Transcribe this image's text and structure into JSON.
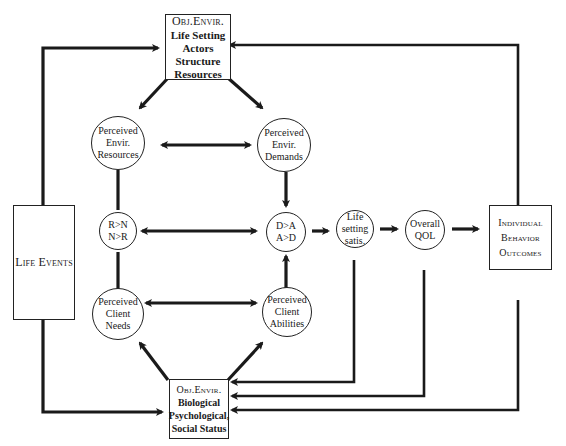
{
  "diagram": {
    "type": "flow-model",
    "boxes": {
      "obj_envir_top": {
        "lines": [
          "Obj.Envir.",
          "Life Setting",
          "Actors",
          "Structure",
          "Resources"
        ]
      },
      "life_events": {
        "lines": [
          "Life Events"
        ]
      },
      "individual_outcomes": {
        "lines": [
          "Individual",
          "Behavior",
          "Outcomes"
        ]
      },
      "obj_envir_bottom": {
        "lines": [
          "Obj.Envir.",
          "Biological",
          "Psychological,",
          "Social Status"
        ]
      }
    },
    "nodes": {
      "perceived_envir_resources": {
        "lines": [
          "Perceived",
          "Envir.",
          "Resources"
        ]
      },
      "perceived_envir_demands": {
        "lines": [
          "Perceived",
          "Envir.",
          "Demands"
        ]
      },
      "r_n": {
        "lines": [
          "R>N",
          "N>R"
        ]
      },
      "d_a": {
        "lines": [
          "D>A",
          "A>D"
        ]
      },
      "life_setting_satis": {
        "lines": [
          "Life",
          "setting",
          "satis."
        ]
      },
      "overall_qol": {
        "lines": [
          "Overall",
          "QOL"
        ]
      },
      "perceived_client_needs": {
        "lines": [
          "Perceived",
          "Client",
          "Needs"
        ]
      },
      "perceived_client_abilities": {
        "lines": [
          "Perceived",
          "Client",
          "Abilities"
        ]
      }
    },
    "edges": [
      {
        "from": "Obj.Envir. Life Setting",
        "to": "Perceived Envir. Resources"
      },
      {
        "from": "Obj.Envir. Life Setting",
        "to": "Perceived Envir. Demands"
      },
      {
        "from": "Perceived Envir. Resources",
        "to": "Perceived Envir. Demands",
        "bidirectional": true
      },
      {
        "from": "Perceived Envir. Demands",
        "to": "D>A A>D"
      },
      {
        "from": "R>N N>R",
        "to": "D>A A>D",
        "bidirectional": true
      },
      {
        "from": "Perceived Client Abilities",
        "to": "D>A A>D"
      },
      {
        "from": "D>A A>D",
        "to": "Life setting satis."
      },
      {
        "from": "Life setting satis.",
        "to": "Overall QOL"
      },
      {
        "from": "Overall QOL",
        "to": "Individual Behavior Outcomes"
      },
      {
        "from": "Perceived Client Needs",
        "to": "Perceived Client Abilities",
        "bidirectional": true
      },
      {
        "from": "Obj.Envir. Biological",
        "to": "Perceived Client Needs"
      },
      {
        "from": "Obj.Envir. Biological",
        "to": "Perceived Client Abilities"
      },
      {
        "from": "Life Events",
        "to": "Obj.Envir. Life Setting"
      },
      {
        "from": "Life Events",
        "to": "Obj.Envir. Biological"
      },
      {
        "from": "Individual Behavior Outcomes",
        "to": "Obj.Envir. Life Setting"
      },
      {
        "from": "Individual Behavior Outcomes",
        "to": "Obj.Envir. Biological"
      },
      {
        "from": "Life setting satis.",
        "to": "Obj.Envir. Biological"
      },
      {
        "from": "Overall QOL",
        "to": "Obj.Envir. Biological"
      }
    ]
  }
}
